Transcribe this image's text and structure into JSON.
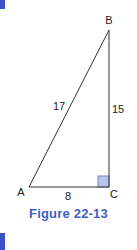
{
  "colors": {
    "accent": "#3a50c8",
    "caption": "#3f5fc4",
    "line": "#333333",
    "right_angle_fill": "#b8c4f0",
    "right_angle_stroke": "#7a86b8"
  },
  "figure": {
    "caption": "Figure 22-13",
    "vertices": {
      "A": {
        "label": "A",
        "x": 29,
        "y": 187
      },
      "B": {
        "label": "B",
        "x": 109,
        "y": 30
      },
      "C": {
        "label": "C",
        "x": 109,
        "y": 187
      }
    },
    "sides": {
      "AB": {
        "label": "17"
      },
      "BC": {
        "label": "15"
      },
      "AC": {
        "label": "8"
      }
    },
    "right_angle_at": "C"
  }
}
